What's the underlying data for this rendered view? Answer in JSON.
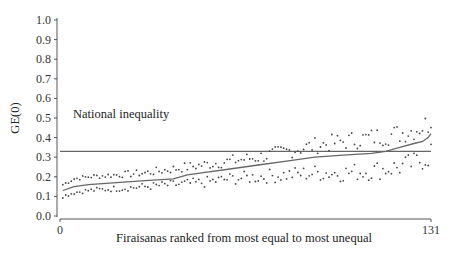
{
  "chart_data": {
    "type": "line",
    "title": "",
    "xlabel": "Firaisanas ranked from most equal to most unequal",
    "ylabel": "GE(0)",
    "xlim": [
      0,
      131
    ],
    "ylim": [
      0.0,
      1.0
    ],
    "x_ticks": [
      "0",
      "131"
    ],
    "y_ticks": [
      "0.0",
      "0.1",
      "0.2",
      "0.3",
      "0.4",
      "0.5",
      "0.6",
      "0.7",
      "0.8",
      "0.9",
      "1.0"
    ],
    "grid": false,
    "legend": null,
    "annotations": [
      {
        "text": "National inequality",
        "type": "hline",
        "y": 0.33
      }
    ],
    "series": [
      {
        "name": "GE(0) estimate",
        "style": "solid line",
        "x": [
          1,
          5,
          10,
          20,
          30,
          40,
          45,
          50,
          60,
          70,
          80,
          90,
          100,
          110,
          115,
          120,
          125,
          128,
          130,
          131
        ],
        "values": [
          0.13,
          0.15,
          0.16,
          0.17,
          0.18,
          0.19,
          0.21,
          0.22,
          0.24,
          0.26,
          0.28,
          0.3,
          0.31,
          0.32,
          0.33,
          0.35,
          0.37,
          0.38,
          0.4,
          0.42
        ]
      },
      {
        "name": "Upper confidence bound",
        "style": "dotted",
        "x": [
          1,
          5,
          10,
          20,
          30,
          40,
          50,
          60,
          70,
          80,
          90,
          100,
          110,
          120,
          125,
          130,
          131
        ],
        "values": [
          0.16,
          0.19,
          0.2,
          0.21,
          0.22,
          0.24,
          0.26,
          0.28,
          0.3,
          0.33,
          0.36,
          0.38,
          0.4,
          0.42,
          0.44,
          0.47,
          0.49
        ]
      },
      {
        "name": "Lower confidence bound",
        "style": "dotted",
        "x": [
          1,
          5,
          10,
          20,
          30,
          40,
          50,
          60,
          70,
          80,
          90,
          100,
          110,
          120,
          125,
          130,
          131
        ],
        "values": [
          0.1,
          0.12,
          0.13,
          0.14,
          0.15,
          0.16,
          0.17,
          0.19,
          0.2,
          0.21,
          0.22,
          0.22,
          0.23,
          0.25,
          0.27,
          0.3,
          0.34
        ]
      }
    ]
  }
}
